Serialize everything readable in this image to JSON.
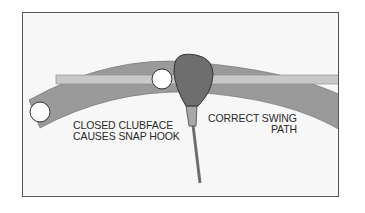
{
  "diagram": {
    "type": "golf swing path illustration",
    "labels": {
      "closed_clubface_line1": "CLOSED CLUBFACE",
      "closed_clubface_line2": "CAUSES SNAP HOOK",
      "correct_path_line1": "CORRECT SWING",
      "correct_path_line2": "PATH"
    },
    "elements": [
      "swing-arc-band",
      "straight-target-line",
      "golf-ball-left",
      "golf-ball-center",
      "clubhead",
      "club-shaft"
    ],
    "colors": {
      "background": "#f7f7f7",
      "frame": "#555555",
      "arc_band": "#9a9a9a",
      "target_line": "#c8c8c8",
      "clubhead": "#6e6e6e",
      "ferrule": "#a8a8a8",
      "ball": "#ffffff",
      "text": "#2a2a2a"
    }
  }
}
